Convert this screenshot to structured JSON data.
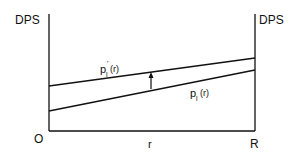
{
  "diagram": {
    "y_axis_left_label": "DPS",
    "y_axis_right_label": "DPS",
    "origin_label": "O",
    "x_axis_label": "r",
    "x_end_label": "R",
    "upper_curve": {
      "label_base": "p",
      "label_sub": "l",
      "label_prime": "'",
      "label_arg": "(r)",
      "full_label": "p'_l(r)"
    },
    "lower_curve": {
      "label_base": "p",
      "label_sub": "l",
      "label_arg": "(r)",
      "full_label": "p_l(r)"
    },
    "arrow": "up-arrow"
  },
  "colors": {
    "ink": "#111111",
    "background": "#ffffff"
  }
}
